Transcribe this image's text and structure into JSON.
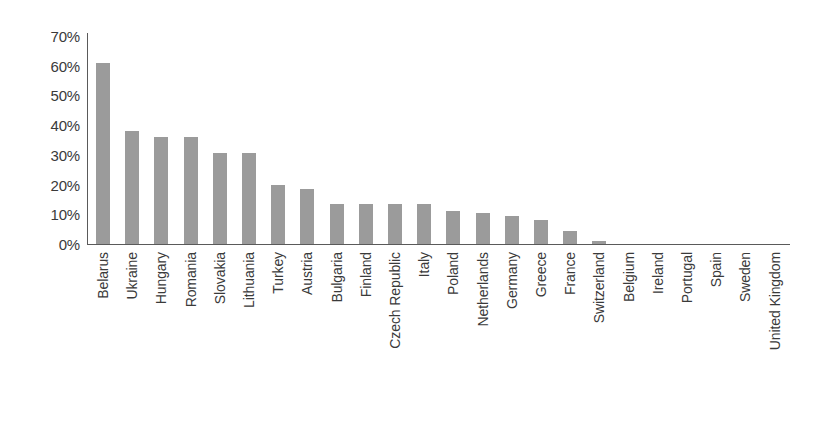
{
  "chart_data": {
    "type": "bar",
    "title": "",
    "subtitle": "",
    "xlabel": "",
    "ylabel": "",
    "ylim": [
      0,
      70
    ],
    "ytick_labels": [
      "70%",
      "60%",
      "50%",
      "40%",
      "30%",
      "20%",
      "10%",
      "0%"
    ],
    "ytick_values": [
      70,
      60,
      50,
      40,
      30,
      20,
      10,
      0
    ],
    "grid": false,
    "legend": false,
    "legend_position": "none",
    "bar_color": "#9b9b9b",
    "axis_color": "#5a5a5a",
    "text_color": "#3a3a3a",
    "value_unit": "%",
    "categories": [
      "Belarus",
      "Ukraine",
      "Hungary",
      "Romania",
      "Slovakia",
      "Lithuania",
      "Turkey",
      "Austria",
      "Bulgaria",
      "Finland",
      "Czech Republic",
      "Italy",
      "Poland",
      "Netherlands",
      "Germany",
      "Greece",
      "France",
      "Switzerland",
      "Belgium",
      "Ireland",
      "Portugal",
      "Spain",
      "Sweden",
      "United Kingdom"
    ],
    "values": [
      61,
      38,
      36,
      36,
      30.5,
      30.5,
      20,
      18.5,
      13.5,
      13.5,
      13.5,
      13.5,
      11,
      10.5,
      9.5,
      8,
      4.5,
      1,
      0,
      0,
      0,
      0,
      0,
      0
    ]
  }
}
